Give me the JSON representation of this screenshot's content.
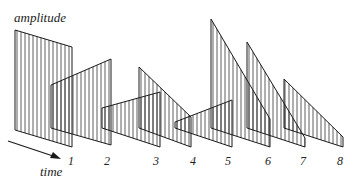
{
  "labels": {
    "y_axis": "amplitude",
    "x_axis": "time"
  },
  "frames": [
    {
      "index": "1",
      "shape": "rectangle-decreasing",
      "points": [
        [
          15,
          30
        ],
        [
          72,
          47
        ],
        [
          72,
          147
        ],
        [
          15,
          130
        ]
      ],
      "label_x": 71
    },
    {
      "index": "2",
      "shape": "ramp-up",
      "points": [
        [
          51,
          85
        ],
        [
          111,
          59
        ],
        [
          111,
          145
        ],
        [
          51,
          128
        ]
      ],
      "label_x": 107
    },
    {
      "index": "3",
      "shape": "wedge-up",
      "points": [
        [
          102,
          108
        ],
        [
          160,
          92
        ],
        [
          160,
          147
        ],
        [
          102,
          128
        ]
      ],
      "label_x": 156
    },
    {
      "index": "3b",
      "shape": "ramp-down",
      "points": [
        [
          139,
          67
        ],
        [
          191,
          117
        ],
        [
          191,
          147
        ],
        [
          139,
          128
        ]
      ],
      "label_x": null
    },
    {
      "index": "4",
      "shape": "wedge-up",
      "points": [
        [
          175,
          122
        ],
        [
          232,
          100
        ],
        [
          232,
          147
        ],
        [
          175,
          128
        ]
      ],
      "label_x": 193
    },
    {
      "index": "5",
      "shape": "ramp-down",
      "points": [
        [
          211,
          19
        ],
        [
          270,
          119
        ],
        [
          270,
          147
        ],
        [
          211,
          128
        ]
      ],
      "label_x": 228
    },
    {
      "index": "6",
      "shape": "ramp-down",
      "points": [
        [
          247,
          42
        ],
        [
          305,
          138
        ],
        [
          305,
          147
        ],
        [
          247,
          128
        ]
      ],
      "label_x": 268
    },
    {
      "index": "7",
      "shape": "ramp-down",
      "points": [
        [
          284,
          79
        ],
        [
          343,
          137
        ],
        [
          343,
          147
        ],
        [
          284,
          128
        ]
      ],
      "label_x": 303
    }
  ],
  "frame_numbers": [
    "1",
    "2",
    "3",
    "4",
    "5",
    "6",
    "7",
    "8"
  ],
  "frame_number_x": [
    71,
    107,
    156,
    193,
    228,
    268,
    303,
    340
  ],
  "colors": {
    "stroke": "#1a1a1a",
    "background": "#ffffff"
  }
}
